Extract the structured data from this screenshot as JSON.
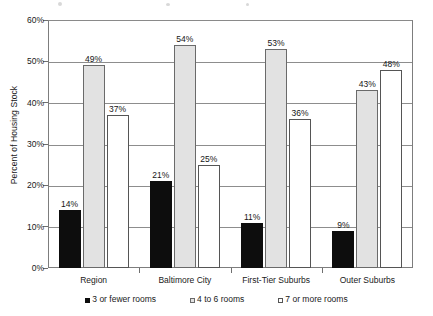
{
  "chart_data": {
    "type": "bar",
    "title": "",
    "subtitle": "",
    "xlabel": "",
    "ylabel": "Percent of Housing Stock",
    "ylim": [
      0,
      60
    ],
    "ytick_labels": [
      "0%",
      "10%",
      "20%",
      "30%",
      "40%",
      "50%",
      "60%"
    ],
    "ytick_values": [
      0,
      10,
      20,
      30,
      40,
      50,
      60
    ],
    "grid": "horizontal",
    "legend_position": "bottom",
    "categories": [
      "Region",
      "Baltimore City",
      "First-Tier Suburbs",
      "Outer Suburbs"
    ],
    "series": [
      {
        "name": "3 or fewer rooms",
        "color": "#0d0d0d",
        "values": [
          14,
          21,
          11,
          9
        ],
        "data_labels": [
          "14%",
          "21%",
          "11%",
          "9%"
        ]
      },
      {
        "name": "4 to 6 rooms",
        "color": "#e2e2e2",
        "values": [
          49,
          54,
          53,
          43
        ],
        "data_labels": [
          "49%",
          "54%",
          "53%",
          "43%"
        ]
      },
      {
        "name": "7 or more rooms",
        "color": "#ffffff",
        "values": [
          37,
          25,
          36,
          48
        ],
        "data_labels": [
          "37%",
          "25%",
          "36%",
          "48%"
        ]
      }
    ]
  },
  "legend": {
    "items": [
      {
        "label": "3 or fewer rooms",
        "swatch": "black-square-icon"
      },
      {
        "label": "4 to 6 rooms",
        "swatch": "gray-square-icon"
      },
      {
        "label": "7 or more rooms",
        "swatch": "white-square-icon"
      }
    ]
  }
}
